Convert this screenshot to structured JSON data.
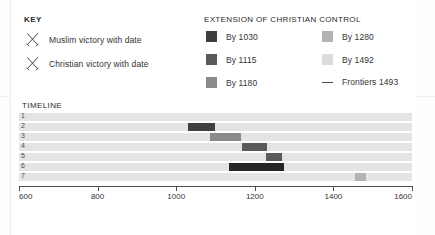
{
  "key": {
    "title": "KEY",
    "items": [
      {
        "icon": "crossed-swords-icon",
        "label": "Muslim victory with date"
      },
      {
        "icon": "crossed-swords-icon",
        "label": "Christian victory with date"
      }
    ]
  },
  "legend": {
    "title": "EXTENSION OF CHRISTIAN CONTROL",
    "items": [
      {
        "label": "By 1030",
        "color": "#3f3f3f",
        "type": "swatch"
      },
      {
        "label": "By 1115",
        "color": "#5a5a5a",
        "type": "swatch"
      },
      {
        "label": "By 1180",
        "color": "#8a8a8a",
        "type": "swatch"
      },
      {
        "label": "By 1280",
        "color": "#b3b3b3",
        "type": "swatch"
      },
      {
        "label": "By 1492",
        "color": "#dcdcdc",
        "type": "swatch"
      },
      {
        "label": "Frontiers 1493",
        "color": "#4a4a4a",
        "type": "line"
      }
    ]
  },
  "timeline": {
    "title": "TIMELINE",
    "track_color": "#e4e4e4",
    "rows": [
      "1",
      "2",
      "3",
      "4",
      "5",
      "6",
      "7"
    ]
  },
  "chart_data": {
    "type": "bar",
    "title": "TIMELINE",
    "orientation": "horizontal",
    "xlabel": "",
    "ylabel": "",
    "xlim": [
      600,
      1600
    ],
    "xticks": [
      600,
      800,
      1000,
      1200,
      1400,
      1600
    ],
    "xtick_labels": [
      "600",
      "800",
      "1000",
      "1200",
      "1400",
      "1600"
    ],
    "grid": false,
    "legend_position": "top-right",
    "categories": [
      "1",
      "2",
      "3",
      "4",
      "5",
      "6",
      "7"
    ],
    "bars": [
      {
        "row": "1",
        "start": null,
        "end": null,
        "color": null,
        "label": ""
      },
      {
        "row": "2",
        "start": 1030,
        "end": 1100,
        "color": "#3f3f3f",
        "label": "By 1030"
      },
      {
        "row": "3",
        "start": 1085,
        "end": 1165,
        "color": "#8a8a8a",
        "label": "By 1180"
      },
      {
        "row": "4",
        "start": 1167,
        "end": 1230,
        "color": "#5a5a5a",
        "label": "By 1115"
      },
      {
        "row": "5",
        "start": 1228,
        "end": 1270,
        "color": "#5a5a5a",
        "label": "By 1115"
      },
      {
        "row": "6",
        "start": 1135,
        "end": 1275,
        "color": "#262626",
        "label": "By 1280"
      },
      {
        "row": "7",
        "start": 1455,
        "end": 1483,
        "color": "#b3b3b3",
        "label": "By 1492"
      }
    ]
  }
}
